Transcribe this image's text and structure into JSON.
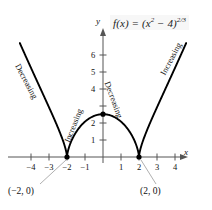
{
  "chart_data": {
    "type": "line",
    "function_label": {
      "lhs": "f(x) = (x",
      "sup1": "2",
      "mid": " − 4)",
      "sup2": "2/3"
    },
    "xlabel": "x",
    "ylabel": "y",
    "xlim": [
      -4.8,
      4.8
    ],
    "ylim": [
      -0.6,
      7.0
    ],
    "grid": false,
    "legend": "none",
    "xticks": [
      -4,
      -3,
      -2,
      -1,
      1,
      2,
      3,
      4
    ],
    "xticklabels": [
      "−4",
      "−3",
      "−2",
      "−1",
      "1",
      "2",
      "3",
      "4"
    ],
    "yticks": [
      1,
      2,
      3,
      4,
      5,
      6
    ],
    "yticklabels": [
      "1",
      "2",
      "3",
      "4",
      "5",
      "6"
    ],
    "yticklabels_visible": [
      "1",
      "2",
      "4",
      "5",
      "6"
    ],
    "curve_color": "#000000",
    "axis_color": "#555555",
    "leader_color": "#999999",
    "points": [
      {
        "name": "left-cusp",
        "x": -2,
        "y": 0,
        "label": "(−2, 0)",
        "marker": "filled-circle"
      },
      {
        "name": "right-cusp",
        "x": 2,
        "y": 0,
        "label": "(2, 0)",
        "marker": "filled-circle"
      },
      {
        "name": "local-max",
        "x": 0,
        "y": 2.52,
        "label": "",
        "marker": "filled-circle"
      }
    ],
    "annotations": [
      {
        "name": "outer-left",
        "text": "Decreasing",
        "interval": "x < -2"
      },
      {
        "name": "inner-left",
        "text": "Increasing",
        "interval": "-2 < x < 0"
      },
      {
        "name": "inner-right",
        "text": "Decreasing",
        "interval": "0 < x < 2"
      },
      {
        "name": "outer-right",
        "text": "Increasing",
        "interval": "x > 2"
      }
    ],
    "series": [
      {
        "name": "f(x) = (x^2 - 4)^(2/3)",
        "x": [
          -4.6,
          -4.4,
          -4.2,
          -4.0,
          -3.8,
          -3.6,
          -3.4,
          -3.2,
          -3.0,
          -2.8,
          -2.6,
          -2.4,
          -2.2,
          -2.1,
          -2.05,
          -2.0,
          -1.95,
          -1.9,
          -1.8,
          -1.6,
          -1.4,
          -1.2,
          -1.0,
          -0.8,
          -0.6,
          -0.4,
          -0.2,
          0.0,
          0.2,
          0.4,
          0.6,
          0.8,
          1.0,
          1.2,
          1.4,
          1.6,
          1.8,
          1.9,
          1.95,
          2.0,
          2.05,
          2.1,
          2.2,
          2.4,
          2.6,
          2.8,
          3.0,
          3.2,
          3.4,
          3.6,
          3.8,
          4.0,
          4.2,
          4.4,
          4.6
        ],
        "y": [
          6.8,
          6.25,
          5.72,
          5.21,
          4.71,
          4.24,
          3.78,
          3.34,
          2.92,
          2.52,
          2.14,
          1.78,
          1.43,
          1.26,
          1.17,
          0.0,
          1.17,
          1.26,
          1.43,
          1.78,
          2.14,
          2.52,
          2.08,
          2.29,
          2.43,
          2.5,
          2.52,
          2.52,
          2.52,
          2.5,
          2.43,
          2.29,
          2.08,
          2.52,
          2.14,
          1.78,
          1.43,
          1.26,
          1.17,
          0.0,
          1.17,
          1.26,
          1.43,
          1.78,
          2.14,
          2.52,
          2.92,
          3.34,
          3.78,
          4.24,
          4.71,
          5.21,
          5.72,
          6.25,
          6.8
        ]
      }
    ]
  }
}
